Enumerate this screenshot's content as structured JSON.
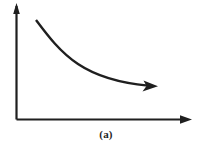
{
  "figure": {
    "caption": "(a)",
    "background_color": "#ffffff",
    "ink_color": "#1f1f1f",
    "axes": {
      "y_axis": {
        "name": "vertical-axis",
        "label": "",
        "has_arrowhead": true,
        "arrow_direction": "up",
        "x": 16.5,
        "y_top": 6,
        "y_bottom": 119.5,
        "stroke_width": 2.2
      },
      "x_axis": {
        "name": "horizontal-axis",
        "label": "",
        "has_arrowhead": true,
        "arrow_direction": "right",
        "y": 119.5,
        "x_left": 16.5,
        "x_right": 186,
        "stroke_width": 2.2
      }
    },
    "curve": {
      "name": "decreasing-curve",
      "label": "",
      "shape": "monotonically decreasing convex",
      "has_arrowhead": true,
      "arrow_direction": "right",
      "stroke_width": 2.4,
      "start": {
        "x": 36,
        "y": 20
      },
      "end": {
        "x": 158,
        "y": 86
      },
      "path": "M 36 20 C 48 36, 60 52, 78 64 C 96 76, 120 83, 148 85.6"
    },
    "arrowheads": {
      "y_axis_head": "M 16.5 3 L 13.2 14 L 19.8 14 Z",
      "x_axis_head": "M 192 119.5 L 180 115.2 L 180 123.8 Z",
      "curve_head": "M 158 86.2 L 143.5 80.5 L 146.5 86.0 L 142.5 91.6 Z"
    }
  },
  "chart_data": {
    "type": "line",
    "title": "",
    "subtitle": "",
    "xlabel": "",
    "ylabel": "",
    "annotations": [
      "(a)"
    ],
    "legend": [],
    "grid": false,
    "axis_arrows": true,
    "tick_labels": {
      "x": [],
      "y": []
    },
    "xlim": [
      0,
      1
    ],
    "ylim": [
      0,
      1
    ],
    "series": [
      {
        "name": "decreasing-curve",
        "x": [
          0.11,
          0.2,
          0.29,
          0.36,
          0.47,
          0.59,
          0.7,
          0.79
        ],
        "y": [
          0.88,
          0.76,
          0.65,
          0.56,
          0.45,
          0.37,
          0.33,
          0.31
        ]
      }
    ]
  }
}
